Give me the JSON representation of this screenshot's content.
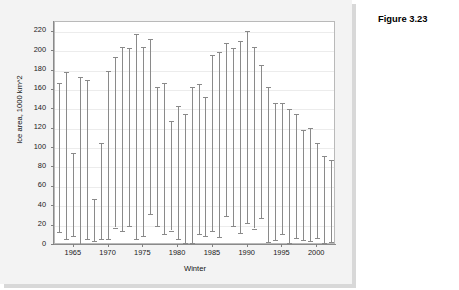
{
  "figure": {
    "title": "Figure 3.23"
  },
  "chart_data": {
    "type": "bar",
    "subtype": "range-bar",
    "title": "",
    "xlabel": "Winter",
    "ylabel": "Ice area, 1000 km^2",
    "ylim": [
      0,
      230
    ],
    "yticks": [
      0,
      20,
      40,
      60,
      80,
      100,
      120,
      140,
      160,
      180,
      200,
      220
    ],
    "ytick_labels": [
      "0",
      "20",
      "40",
      "60",
      "80",
      "100",
      "120",
      "140",
      "160",
      "180",
      "200",
      "220"
    ],
    "xlim": [
      1962.3,
      2002.7
    ],
    "xticks": [
      1965,
      1970,
      1975,
      1980,
      1985,
      1990,
      1995,
      2000
    ],
    "xtick_labels": [
      "1965",
      "1970",
      "1975",
      "1980",
      "1985",
      "1990",
      "1995",
      "2000"
    ],
    "grid": "horizontal",
    "legend": "none",
    "bar_color": "#8a8a8a",
    "categories": [
      1963,
      1964,
      1965,
      1966,
      1967,
      1968,
      1969,
      1970,
      1971,
      1972,
      1973,
      1974,
      1975,
      1976,
      1977,
      1978,
      1979,
      1980,
      1981,
      1982,
      1983,
      1984,
      1985,
      1986,
      1987,
      1988,
      1989,
      1990,
      1991,
      1992,
      1993,
      1994,
      1995,
      1996,
      1997,
      1998,
      1999,
      2000,
      2001,
      2002
    ],
    "series": [
      {
        "name": "minimum ice area",
        "values": [
          13,
          6,
          9,
          1,
          6,
          4,
          6,
          6,
          18,
          14,
          20,
          6,
          9,
          32,
          20,
          11,
          15,
          6,
          2,
          2,
          11,
          9,
          15,
          8,
          30,
          20,
          12,
          23,
          17,
          28,
          3,
          5,
          11,
          2,
          7,
          5,
          4,
          7,
          2,
          3
        ]
      },
      {
        "name": "maximum ice area",
        "values": [
          167,
          178,
          95,
          173,
          170,
          47,
          105,
          179,
          194,
          204,
          203,
          218,
          204,
          213,
          163,
          167,
          128,
          143,
          135,
          163,
          166,
          153,
          196,
          199,
          208,
          203,
          210,
          221,
          204,
          186,
          163,
          147,
          147,
          140,
          135,
          119,
          121,
          105,
          92,
          88
        ]
      }
    ]
  }
}
